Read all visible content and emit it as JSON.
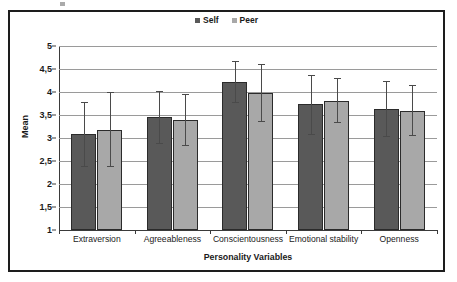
{
  "chart_data": {
    "type": "bar",
    "title": "",
    "xlabel": "Personality Variables",
    "ylabel": "Mean",
    "ylim": [
      1,
      5
    ],
    "grid": true,
    "legend_position": "top-center",
    "categories": [
      "Extraversion",
      "Agreeableness",
      "Conscientousness",
      "Emotional stability",
      "Openness"
    ],
    "y_tick_labels": [
      "1",
      "1,5",
      "2",
      "2,5",
      "3",
      "3,5",
      "4",
      "4,5",
      "5"
    ],
    "y_tick_values": [
      1,
      1.5,
      2,
      2.5,
      3,
      3.5,
      4,
      4.5,
      5
    ],
    "series": [
      {
        "name": "Self",
        "color": "#595959",
        "values": [
          3.08,
          3.45,
          4.22,
          3.75,
          3.63
        ],
        "error_low": [
          2.38,
          2.88,
          3.76,
          3.06,
          3.03
        ],
        "error_high": [
          3.78,
          4.02,
          4.67,
          4.36,
          4.23
        ]
      },
      {
        "name": "Peer",
        "color": "#a8a8a8",
        "values": [
          3.17,
          3.39,
          3.98,
          3.8,
          3.58
        ],
        "error_low": [
          2.38,
          2.82,
          3.34,
          3.32,
          3.04
        ],
        "error_high": [
          4.0,
          3.95,
          4.6,
          4.3,
          4.15
        ]
      }
    ]
  },
  "legend": {
    "entries": [
      {
        "label": "Self",
        "swatch": "self-legend-swatch"
      },
      {
        "label": "Peer",
        "swatch": "peer-legend-swatch"
      }
    ]
  }
}
